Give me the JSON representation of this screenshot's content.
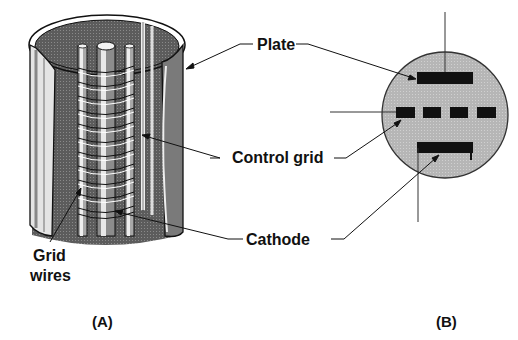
{
  "diagram": {
    "labels": {
      "plate": "Plate",
      "control_grid": "Control grid",
      "cathode": "Cathode",
      "grid_wires_line1": "Grid",
      "grid_wires_line2": "wires"
    },
    "panels": {
      "a": "(A)",
      "b": "(B)"
    },
    "colors": {
      "ink": "#111111",
      "shading_dark": "#5a5a5a",
      "shading_mid": "#9a9a9a",
      "shading_light": "#d4d4d4",
      "envelope_fill": "#b4b4b4",
      "background": "#ffffff"
    }
  }
}
